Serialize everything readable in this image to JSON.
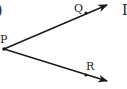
{
  "diagram": {
    "type": "angle",
    "vertex": {
      "label": "P",
      "x": 4,
      "y": 49
    },
    "rays": [
      {
        "name": "PQ",
        "point_label": "Q",
        "point": {
          "x": 86,
          "y": 13
        },
        "end": {
          "x": 107,
          "y": 5
        }
      },
      {
        "name": "PR",
        "point_label": "R",
        "point": {
          "x": 86,
          "y": 76
        },
        "end": {
          "x": 107,
          "y": 81
        }
      }
    ],
    "partial_left_glyph": ")",
    "partial_right_glyph": "I",
    "colors": {
      "stroke": "#1a1a1a",
      "background": "#ffffff"
    }
  }
}
